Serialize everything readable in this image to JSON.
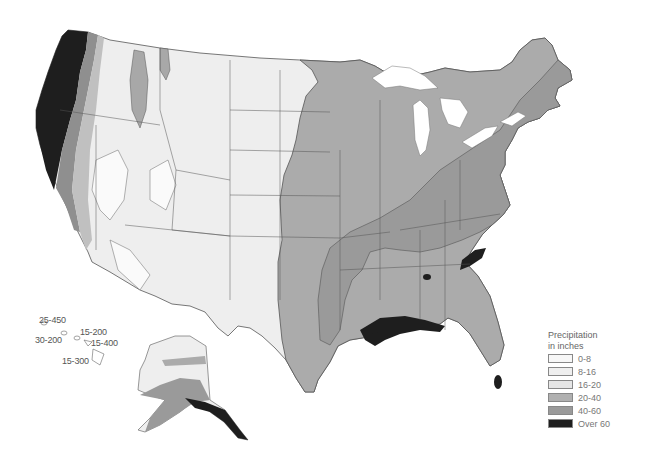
{
  "legend": {
    "title_line1": "Precipitation",
    "title_line2": "in inches",
    "items": [
      {
        "label": "0-8",
        "color": "#f7f7f7"
      },
      {
        "label": "8-16",
        "color": "#efefef"
      },
      {
        "label": "16-20",
        "color": "#e6e6e6"
      },
      {
        "label": "20-40",
        "color": "#b0b0b0"
      },
      {
        "label": "40-60",
        "color": "#9a9a9a"
      },
      {
        "label": "Over 60",
        "color": "#1e1e1e"
      }
    ]
  },
  "hawaii": {
    "labels": [
      "25-450",
      "15-200",
      "30-200",
      "15-400",
      "15-300"
    ]
  },
  "colors": {
    "background": "#ffffff",
    "border": "#555555",
    "water": "#ffffff"
  }
}
